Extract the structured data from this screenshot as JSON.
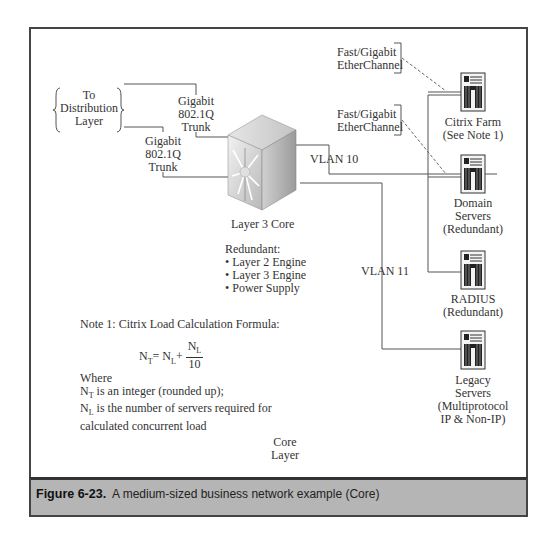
{
  "diagram": {
    "distribution": {
      "label_lines": [
        "To",
        "Distribution",
        "Layer"
      ]
    },
    "trunks": [
      {
        "label_lines": [
          "Gigabit",
          "802.1Q",
          "Trunk"
        ]
      },
      {
        "label_lines": [
          "Gigabit",
          "802.1Q",
          "Trunk"
        ]
      }
    ],
    "core": {
      "label": "Layer 3 Core",
      "redundant_heading": "Redundant:",
      "redundant_items": [
        "• Layer 2 Engine",
        "• Layer 3 Engine",
        "• Power Supply"
      ]
    },
    "vlans": [
      {
        "label": "VLAN 10"
      },
      {
        "label": "VLAN 11"
      }
    ],
    "etherchannels": [
      {
        "label_lines": [
          "Fast/Gigabit",
          "EtherChannel"
        ]
      },
      {
        "label_lines": [
          "Fast/Gigabit",
          "EtherChannel"
        ]
      }
    ],
    "servers": [
      {
        "label_lines": [
          "Citrix Farm",
          "(See Note 1)"
        ]
      },
      {
        "label_lines": [
          "Domain",
          "Servers",
          "(Redundant)"
        ]
      },
      {
        "label_lines": [
          "RADIUS",
          "(Redundant)"
        ]
      },
      {
        "label_lines": [
          "Legacy",
          "Servers",
          "(Multiprotocol",
          "IP & Non-IP)"
        ]
      }
    ],
    "note": {
      "title": "Note 1: Citrix Load Calculation Formula:",
      "formula": {
        "lhs": "N",
        "lhs_sub": "T",
        "eq": "= N",
        "mid_sub": "L",
        "plus": "+",
        "num": "N",
        "num_sub": "L",
        "den": "10"
      },
      "where": "Where",
      "line1_var": "N",
      "line1_sub": "T",
      "line1_text": " is an integer (rounded up);",
      "line2_var": "N",
      "line2_sub": "L",
      "line2_text": " is the number of servers required for",
      "line3_text": "calculated concurrent load"
    },
    "layer_label_lines": [
      "Core",
      "Layer"
    ]
  },
  "caption": {
    "number": "Figure 6-23.",
    "text": "A medium-sized business network example (Core)"
  },
  "colors": {
    "frame": "#444444",
    "caption_bg": "#b5b5b5",
    "line": "#555555"
  }
}
